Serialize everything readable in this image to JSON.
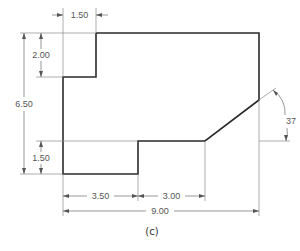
{
  "drawing": {
    "caption": "(c)",
    "dimensions": {
      "top_step_width": "1.50",
      "top_step_height": "2.00",
      "overall_height": "6.50",
      "bottom_step_height": "1.50",
      "bottom_left_width": "3.50",
      "bottom_middle_width": "3.00",
      "overall_width": "9.00",
      "chamfer_angle": "37"
    },
    "units_note": "",
    "line_color": "#2a2a2a",
    "dimension_color": "#6a6a6a"
  }
}
